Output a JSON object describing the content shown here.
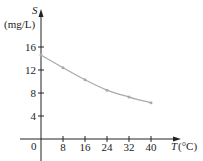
{
  "chart_data": {
    "type": "line",
    "title": "",
    "xlabel": "T (°C)",
    "ylabel": "S (mg/L)",
    "x_axis_var": "T",
    "x_axis_unit": "(°C)",
    "y_axis_var": "S",
    "y_axis_unit": "(mg/L)",
    "x": [
      0,
      8,
      16,
      24,
      32,
      40
    ],
    "series": [
      {
        "name": "S",
        "values": [
          14.6,
          12.4,
          10.3,
          8.5,
          7.3,
          6.3
        ],
        "markers": true,
        "color": "#aaaaaa"
      }
    ],
    "x_ticks": [
      "8",
      "16",
      "24",
      "32",
      "40"
    ],
    "y_ticks": [
      "4",
      "8",
      "12",
      "16"
    ],
    "origin_label": "0",
    "xlim": [
      0,
      48
    ],
    "ylim": [
      0,
      20
    ],
    "grid": false,
    "legend": "none"
  },
  "colors": {
    "axis": "#222222",
    "curve": "#aaaaaa"
  }
}
